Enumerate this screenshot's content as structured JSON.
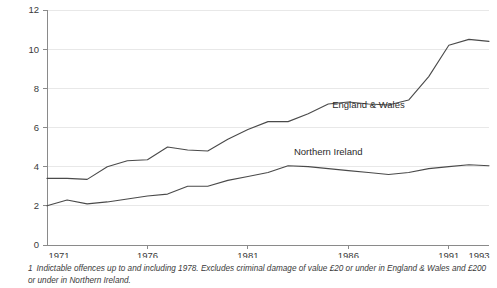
{
  "chart_data": {
    "type": "line",
    "title": "",
    "subtitle": "",
    "xlabel": "",
    "ylabel": "",
    "xlim": [
      1971,
      1993
    ],
    "ylim": [
      0,
      12
    ],
    "y_ticks": [
      0,
      2,
      4,
      6,
      8,
      10,
      12
    ],
    "y_tick_labels": [
      "0",
      "2",
      "4",
      "6",
      "8",
      "10",
      "12"
    ],
    "x_ticks": [
      1971,
      1976,
      1981,
      1986,
      1991,
      1993
    ],
    "x_tick_labels": [
      "1971",
      "1976",
      "1981",
      "1986",
      "1991",
      "1993"
    ],
    "grid": "horizontal",
    "legend_position": "inline-labels",
    "line_color": "#4a4a4a",
    "grid_color": "#e8e8e8",
    "axis_color": "#8a8a8a",
    "x": [
      1971,
      1972,
      1973,
      1974,
      1975,
      1976,
      1977,
      1978,
      1979,
      1980,
      1981,
      1982,
      1983,
      1984,
      1985,
      1986,
      1987,
      1988,
      1989,
      1990,
      1991,
      1992,
      1993
    ],
    "series": [
      {
        "name": "England & Wales",
        "label_x": 1987,
        "label_y": 7.0,
        "values": [
          3.4,
          3.4,
          3.35,
          4.0,
          4.3,
          4.35,
          5.0,
          4.85,
          4.8,
          5.4,
          5.9,
          6.3,
          6.3,
          6.7,
          7.2,
          7.3,
          7.2,
          7.15,
          7.4,
          8.6,
          10.2,
          10.5,
          10.4
        ]
      },
      {
        "name": "Northern Ireland",
        "label_x": 1985,
        "label_y": 4.6,
        "values": [
          2.0,
          2.3,
          2.1,
          2.2,
          2.35,
          2.5,
          2.6,
          3.0,
          3.0,
          3.3,
          3.5,
          3.7,
          4.05,
          4.0,
          3.9,
          3.8,
          3.7,
          3.6,
          3.7,
          3.9,
          4.0,
          4.1,
          4.05
        ]
      }
    ]
  },
  "footnote": {
    "marker": "1",
    "text": "Indictable offences up to and including 1978. Excludes criminal damage of value £20 or under in England & Wales and £200 or under in Northern Ireland."
  }
}
